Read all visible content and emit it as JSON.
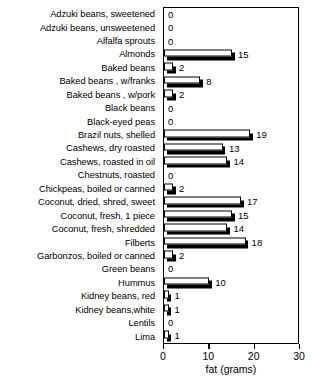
{
  "chart_data": {
    "type": "bar",
    "orientation": "horizontal",
    "title": "",
    "xlabel": "fat (grams)",
    "ylabel": "",
    "xlim": [
      0,
      30
    ],
    "xticks": [
      0,
      10,
      20,
      30
    ],
    "grid": false,
    "legend": null,
    "show_value_labels": true,
    "categories": [
      "Adzuki beans, sweetened",
      "Adzuki beans, unsweetened",
      "Alfalfa sprouts",
      "Almonds",
      "Baked beans",
      "Baked beans , w/franks",
      "Baked beans , w/pork",
      "Black beans",
      "Black-eyed peas",
      "Brazil nuts, shelled",
      "Cashews, dry roasted",
      "Cashews, roasted in oil",
      "Chestnuts, roasted",
      "Chickpeas, boiled or canned",
      "Coconut, dried, shred, sweet",
      "Coconut, fresh, 1 piece",
      "Coconut, fresh, shredded",
      "Filberts",
      "Garbonzos, boiled or canned",
      "Green beans",
      "Hummus",
      "Kidney beans, red",
      "Kidney beans,white",
      "Lentils",
      "Lima"
    ],
    "values": [
      0,
      0,
      0,
      15,
      2,
      8,
      2,
      0,
      0,
      19,
      13,
      14,
      0,
      2,
      17,
      15,
      14,
      18,
      2,
      0,
      10,
      1,
      1,
      0,
      1
    ],
    "value_labels": [
      "0",
      "0",
      "0",
      "15",
      "2",
      "8",
      "2",
      "0",
      "0",
      "19",
      "13",
      "14",
      "0",
      "2",
      "17",
      "15",
      "14",
      "18",
      "2",
      "0",
      "10",
      "1",
      "1",
      "0",
      "1"
    ],
    "colors": {
      "bar_face": "#ffffff",
      "bar_outline": "#000000",
      "bar_shadow": "#000000",
      "axis": "#000000",
      "background": "#ffffff",
      "text": "#000000"
    }
  }
}
